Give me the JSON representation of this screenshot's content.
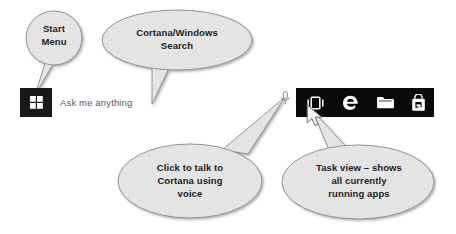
{
  "diagram": {
    "background_color": "#ffffff",
    "callout_fill": "#e4e4e4",
    "callout_stroke": "#8a8a8a",
    "taskbar_color": "#0a0a0a",
    "start_button_color": "#181818"
  },
  "callouts": [
    {
      "id": "start-menu",
      "text": "Start\nMenu",
      "points_to": "start-button"
    },
    {
      "id": "cortana-search",
      "text": "Cortana/Windows\nSearch",
      "points_to": "ask-me-anything-search-box"
    },
    {
      "id": "cortana-voice",
      "text": "Click to talk to\nCortana using\nvoice",
      "points_to": "microphone-icon"
    },
    {
      "id": "task-view",
      "text": "Task view – shows\nall currently\nrunning apps",
      "points_to": "task-view-button"
    }
  ],
  "taskbar": {
    "search_placeholder": "Ask me anything",
    "start_button_label": "Start",
    "buttons": [
      {
        "id": "task-view",
        "icon": "task-view-icon",
        "label": "Task View"
      },
      {
        "id": "edge",
        "icon": "edge-icon",
        "label": "Microsoft Edge"
      },
      {
        "id": "file-explorer",
        "icon": "folder-icon",
        "label": "File Explorer"
      },
      {
        "id": "store",
        "icon": "shopping-bag-icon",
        "label": "Microsoft Store"
      }
    ],
    "cursor": {
      "over": "task-view-button"
    }
  }
}
